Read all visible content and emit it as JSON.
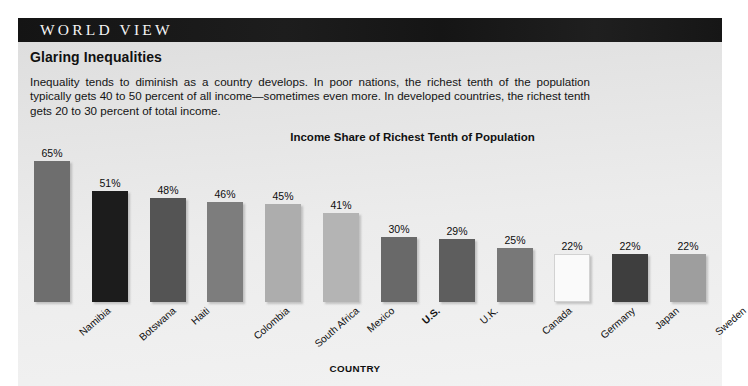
{
  "masthead": {
    "title": "WORLD VIEW",
    "background_color": "#171717",
    "text_color": "#f4f4f4"
  },
  "article": {
    "headline": "Glaring Inequalities",
    "body": "Inequality tends to diminish as a country develops. In poor nations, the richest tenth of the population typically gets 40 to 50 percent of all income—sometimes even more. In developed countries, the richest tenth gets 20 to 30 percent of total income."
  },
  "panel": {
    "background_color": "#e9e9e9"
  },
  "chart_data": {
    "type": "bar",
    "title": "Income Share of Richest Tenth of Population",
    "xlabel": "COUNTRY",
    "ylabel": "",
    "ylim": [
      0,
      70
    ],
    "grid": false,
    "legend": "none",
    "value_suffix": "%",
    "categories": [
      "Namibia",
      "Botswana",
      "Haiti",
      "Colombia",
      "South Africa",
      "Mexico",
      "U.S.",
      "U.K.",
      "Canada",
      "Germany",
      "Japan",
      "Sweden"
    ],
    "values": [
      65,
      51,
      48,
      46,
      45,
      41,
      30,
      29,
      25,
      22,
      22,
      22
    ],
    "value_labels": [
      "65%",
      "51%",
      "48%",
      "46%",
      "45%",
      "41%",
      "30%",
      "29%",
      "25%",
      "22%",
      "22%",
      "22%"
    ],
    "bar_colors": [
      "#6e6e6e",
      "#1c1c1c",
      "#545454",
      "#7d7d7d",
      "#adadad",
      "#b4b4b4",
      "#696969",
      "#5e5e5e",
      "#787878",
      "#fafafa",
      "#3e3e3e",
      "#9e9e9e"
    ],
    "emphasized_category": "U.S."
  }
}
